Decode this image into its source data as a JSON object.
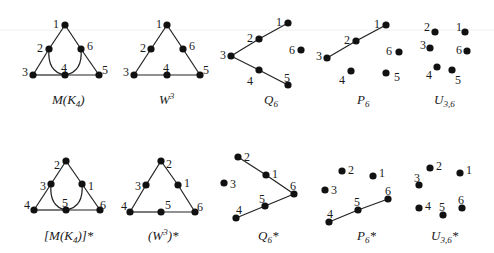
{
  "figure": {
    "rows": [
      {
        "row": "top",
        "graphs": [
          {
            "id": "MK4",
            "caption": {
              "pre": "M(K",
              "sub": "4",
              "post": ")"
            },
            "vertices": [
              {
                "label": "1",
                "x": 65,
                "y": 25,
                "lx": 53,
                "ly": 24
              },
              {
                "label": "2",
                "x": 49,
                "y": 49,
                "lx": 37,
                "ly": 48
              },
              {
                "label": "6",
                "x": 81,
                "y": 49,
                "lx": 87,
                "ly": 46
              },
              {
                "label": "3",
                "x": 33,
                "y": 75,
                "lx": 22,
                "ly": 72
              },
              {
                "label": "4",
                "x": 65,
                "y": 75,
                "lx": 61,
                "ly": 68
              },
              {
                "label": "5",
                "x": 99,
                "y": 75,
                "lx": 102,
                "ly": 70
              }
            ],
            "edges": [
              {
                "from": 0,
                "to": 1
              },
              {
                "from": 1,
                "to": 3
              },
              {
                "from": 0,
                "to": 2
              },
              {
                "from": 2,
                "to": 5
              },
              {
                "from": 3,
                "to": 4
              },
              {
                "from": 4,
                "to": 5
              }
            ],
            "curves": [
              {
                "d": "M49,49 Q47,72 65,75"
              },
              {
                "d": "M81,49 Q83,72 65,75"
              }
            ],
            "caption_pos": {
              "x": 52,
              "y": 104
            }
          },
          {
            "id": "W3",
            "caption": {
              "pre": "W",
              "sup": "3",
              "post": ""
            },
            "vertices": [
              {
                "label": "1",
                "x": 167,
                "y": 25,
                "lx": 156,
                "ly": 24
              },
              {
                "label": "2",
                "x": 151,
                "y": 49,
                "lx": 140,
                "ly": 48
              },
              {
                "label": "6",
                "x": 183,
                "y": 49,
                "lx": 189,
                "ly": 46
              },
              {
                "label": "3",
                "x": 134,
                "y": 75,
                "lx": 123,
                "ly": 72
              },
              {
                "label": "4",
                "x": 167,
                "y": 75,
                "lx": 163,
                "ly": 68
              },
              {
                "label": "5",
                "x": 200,
                "y": 75,
                "lx": 203,
                "ly": 70
              }
            ],
            "edges": [
              {
                "from": 0,
                "to": 1
              },
              {
                "from": 1,
                "to": 3
              },
              {
                "from": 0,
                "to": 2
              },
              {
                "from": 2,
                "to": 5
              },
              {
                "from": 3,
                "to": 4
              },
              {
                "from": 4,
                "to": 5
              }
            ],
            "curves": [],
            "caption_pos": {
              "x": 159,
              "y": 104
            }
          },
          {
            "id": "Q6",
            "caption": {
              "pre": "Q",
              "sub": "6",
              "post": ""
            },
            "vertices": [
              {
                "label": "1",
                "x": 288,
                "y": 23,
                "lx": 276,
                "ly": 22
              },
              {
                "label": "2",
                "x": 259,
                "y": 39,
                "lx": 247,
                "ly": 38
              },
              {
                "label": "3",
                "x": 231,
                "y": 56,
                "lx": 220,
                "ly": 55
              },
              {
                "label": "4",
                "x": 259,
                "y": 70,
                "lx": 247,
                "ly": 81
              },
              {
                "label": "5",
                "x": 288,
                "y": 85,
                "lx": 284,
                "ly": 78
              },
              {
                "label": "6",
                "x": 301,
                "y": 50,
                "lx": 289,
                "ly": 50
              }
            ],
            "edges": [
              {
                "from": 0,
                "to": 1
              },
              {
                "from": 1,
                "to": 2
              },
              {
                "from": 2,
                "to": 3
              },
              {
                "from": 3,
                "to": 4
              }
            ],
            "curves": [],
            "caption_pos": {
              "x": 264,
              "y": 104
            }
          },
          {
            "id": "P6",
            "caption": {
              "pre": "P",
              "sub": "6",
              "post": ""
            },
            "vertices": [
              {
                "label": "1",
                "x": 386,
                "y": 25,
                "lx": 374,
                "ly": 24
              },
              {
                "label": "2",
                "x": 356,
                "y": 41,
                "lx": 344,
                "ly": 40
              },
              {
                "label": "3",
                "x": 327,
                "y": 58,
                "lx": 316,
                "ly": 56
              },
              {
                "label": "4",
                "x": 351,
                "y": 71,
                "lx": 339,
                "ly": 80
              },
              {
                "label": "5",
                "x": 386,
                "y": 73,
                "lx": 394,
                "ly": 77
              },
              {
                "label": "6",
                "x": 399,
                "y": 52,
                "lx": 386,
                "ly": 51
              }
            ],
            "edges": [
              {
                "from": 0,
                "to": 1
              },
              {
                "from": 1,
                "to": 2
              }
            ],
            "curves": [],
            "caption_pos": {
              "x": 357,
              "y": 104
            }
          },
          {
            "id": "U36",
            "caption": {
              "pre": "U",
              "sub": "3,6",
              "post": ""
            },
            "vertices": [
              {
                "label": "1",
                "x": 465,
                "y": 32,
                "lx": 456,
                "ly": 27
              },
              {
                "label": "2",
                "x": 435,
                "y": 32,
                "lx": 424,
                "ly": 27
              },
              {
                "label": "3",
                "x": 430,
                "y": 48,
                "lx": 420,
                "ly": 45
              },
              {
                "label": "4",
                "x": 437,
                "y": 67,
                "lx": 426,
                "ly": 75
              },
              {
                "label": "5",
                "x": 452,
                "y": 70,
                "lx": 455,
                "ly": 80
              },
              {
                "label": "6",
                "x": 467,
                "y": 51,
                "lx": 456,
                "ly": 50
              }
            ],
            "edges": [],
            "curves": [],
            "caption_pos": {
              "x": 434,
              "y": 104
            }
          }
        ]
      },
      {
        "row": "bottom",
        "graphs": [
          {
            "id": "MK4_dual",
            "caption": {
              "pre": "[M(K",
              "sub": "4",
              "post": ")]*"
            },
            "vertices": [
              {
                "label": "2",
                "x": 66,
                "y": 161,
                "lx": 54,
                "ly": 165
              },
              {
                "label": "3",
                "x": 51,
                "y": 184,
                "lx": 40,
                "ly": 186
              },
              {
                "label": "1",
                "x": 82,
                "y": 184,
                "lx": 88,
                "ly": 186
              },
              {
                "label": "4",
                "x": 34,
                "y": 210,
                "lx": 24,
                "ly": 205
              },
              {
                "label": "5",
                "x": 66,
                "y": 210,
                "lx": 62,
                "ly": 203
              },
              {
                "label": "6",
                "x": 100,
                "y": 210,
                "lx": 100,
                "ly": 205
              }
            ],
            "edges": [
              {
                "from": 0,
                "to": 1
              },
              {
                "from": 1,
                "to": 3
              },
              {
                "from": 0,
                "to": 2
              },
              {
                "from": 2,
                "to": 5
              },
              {
                "from": 3,
                "to": 4
              },
              {
                "from": 4,
                "to": 5
              }
            ],
            "curves": [
              {
                "d": "M51,184 Q49,207 66,210"
              },
              {
                "d": "M82,184 Q84,207 66,210"
              }
            ],
            "caption_pos": {
              "x": 44,
              "y": 240
            }
          },
          {
            "id": "W3_dual",
            "caption": {
              "pre": "(W",
              "sup": "3",
              "post": ")*"
            },
            "vertices": [
              {
                "label": "2",
                "x": 161,
                "y": 161,
                "lx": 166,
                "ly": 164
              },
              {
                "label": "3",
                "x": 146,
                "y": 185,
                "lx": 135,
                "ly": 186
              },
              {
                "label": "1",
                "x": 178,
                "y": 185,
                "lx": 184,
                "ly": 183
              },
              {
                "label": "4",
                "x": 130,
                "y": 212,
                "lx": 121,
                "ly": 206
              },
              {
                "label": "5",
                "x": 161,
                "y": 212,
                "lx": 165,
                "ly": 205
              },
              {
                "label": "6",
                "x": 195,
                "y": 212,
                "lx": 197,
                "ly": 207
              }
            ],
            "edges": [
              {
                "from": 0,
                "to": 1
              },
              {
                "from": 1,
                "to": 3
              },
              {
                "from": 0,
                "to": 2
              },
              {
                "from": 2,
                "to": 5
              },
              {
                "from": 3,
                "to": 4
              },
              {
                "from": 4,
                "to": 5
              }
            ],
            "curves": [],
            "caption_pos": {
              "x": 148,
              "y": 240
            }
          },
          {
            "id": "Q6_dual",
            "caption": {
              "pre": "Q",
              "sub": "6",
              "post": "*"
            },
            "vertices": [
              {
                "label": "2",
                "x": 238,
                "y": 157,
                "lx": 244,
                "ly": 157
              },
              {
                "label": "1",
                "x": 266,
                "y": 175,
                "lx": 272,
                "ly": 174
              },
              {
                "label": "6",
                "x": 294,
                "y": 194,
                "lx": 290,
                "ly": 186
              },
              {
                "label": "3",
                "x": 224,
                "y": 183,
                "lx": 230,
                "ly": 184
              },
              {
                "label": "5",
                "x": 265,
                "y": 206,
                "lx": 259,
                "ly": 199
              },
              {
                "label": "4",
                "x": 236,
                "y": 218,
                "lx": 236,
                "ly": 210
              }
            ],
            "edges": [
              {
                "from": 0,
                "to": 1
              },
              {
                "from": 1,
                "to": 2
              },
              {
                "from": 2,
                "to": 4
              },
              {
                "from": 4,
                "to": 5
              }
            ],
            "curves": [],
            "caption_pos": {
              "x": 258,
              "y": 240
            }
          },
          {
            "id": "P6_dual",
            "caption": {
              "pre": "P",
              "sub": "6",
              "post": "*"
            },
            "vertices": [
              {
                "label": "2",
                "x": 342,
                "y": 171,
                "lx": 348,
                "ly": 170
              },
              {
                "label": "1",
                "x": 373,
                "y": 176,
                "lx": 379,
                "ly": 173
              },
              {
                "label": "3",
                "x": 325,
                "y": 190,
                "lx": 331,
                "ly": 190
              },
              {
                "label": "6",
                "x": 388,
                "y": 199,
                "lx": 385,
                "ly": 191
              },
              {
                "label": "5",
                "x": 358,
                "y": 210,
                "lx": 354,
                "ly": 202
              },
              {
                "label": "4",
                "x": 329,
                "y": 222,
                "lx": 327,
                "ly": 214
              }
            ],
            "edges": [
              {
                "from": 3,
                "to": 4
              },
              {
                "from": 4,
                "to": 5
              }
            ],
            "curves": [],
            "caption_pos": {
              "x": 357,
              "y": 240
            }
          },
          {
            "id": "U36_dual",
            "caption": {
              "pre": "U",
              "sub": "3,6",
              "post": "*"
            },
            "vertices": [
              {
                "label": "2",
                "x": 430,
                "y": 168,
                "lx": 436,
                "ly": 166
              },
              {
                "label": "1",
                "x": 460,
                "y": 173,
                "lx": 466,
                "ly": 170
              },
              {
                "label": "3",
                "x": 419,
                "y": 185,
                "lx": 414,
                "ly": 178
              },
              {
                "label": "4",
                "x": 419,
                "y": 208,
                "lx": 425,
                "ly": 206
              },
              {
                "label": "5",
                "x": 443,
                "y": 215,
                "lx": 439,
                "ly": 207
              },
              {
                "label": "6",
                "x": 462,
                "y": 208,
                "lx": 458,
                "ly": 200
              }
            ],
            "edges": [],
            "curves": [],
            "caption_pos": {
              "x": 431,
              "y": 240
            }
          }
        ]
      }
    ]
  }
}
